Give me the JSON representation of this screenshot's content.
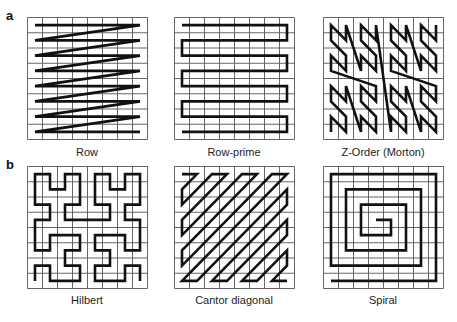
{
  "panels": [
    {
      "letter": "a"
    },
    {
      "letter": "b"
    }
  ],
  "figures": [
    {
      "id": "row",
      "label": "Row",
      "panel": "a",
      "x": 27,
      "y": 17,
      "w": 120,
      "h": 122,
      "label_y": 146
    },
    {
      "id": "row-prime",
      "label": "Row-prime",
      "panel": "a",
      "x": 174,
      "y": 17,
      "w": 120,
      "h": 122,
      "label_y": 146
    },
    {
      "id": "z-order",
      "label": "Z-Order (Morton)",
      "panel": "a",
      "x": 323,
      "y": 17,
      "w": 120,
      "h": 122,
      "label_y": 146
    },
    {
      "id": "hilbert",
      "label": "Hilbert",
      "panel": "b",
      "x": 27,
      "y": 166,
      "w": 120,
      "h": 122,
      "label_y": 294
    },
    {
      "id": "cantor-diagonal",
      "label": "Cantor diagonal",
      "panel": "b",
      "x": 174,
      "y": 166,
      "w": 120,
      "h": 122,
      "label_y": 294
    },
    {
      "id": "spiral",
      "label": "Spiral",
      "panel": "b",
      "x": 323,
      "y": 166,
      "w": 120,
      "h": 122,
      "label_y": 294
    }
  ],
  "grid": {
    "cells": 8,
    "grid_color": "#555555",
    "curve_color": "#111111"
  }
}
